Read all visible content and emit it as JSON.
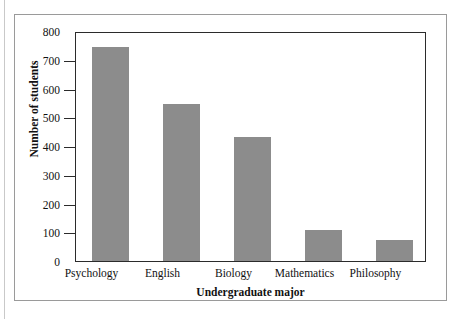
{
  "figure": {
    "background_color": "#ffffff",
    "frame_color": "#9a9a9a",
    "axis_color": "#2b2b2b",
    "bar_color": "#8c8c8c"
  },
  "chart_data": {
    "type": "bar",
    "title": "",
    "subtitle": "",
    "xlabel": "Undergraduate major",
    "ylabel": "Number of students",
    "categories": [
      "Psychology",
      "English",
      "Biology",
      "Mathematics",
      "Philosophy"
    ],
    "values": [
      750,
      550,
      435,
      110,
      75
    ],
    "series": [
      {
        "name": "Number of students",
        "values": [
          750,
          550,
          435,
          110,
          75
        ]
      }
    ],
    "ylim": [
      0,
      800
    ],
    "yticks": [
      0,
      100,
      200,
      300,
      400,
      500,
      600,
      700,
      800
    ],
    "ytick_labels": [
      "0",
      "100",
      "200",
      "300",
      "400",
      "500",
      "600",
      "700",
      "800"
    ],
    "grid": false,
    "legend": false,
    "legend_position": "none",
    "bar_color": "#8c8c8c",
    "annotations": []
  }
}
